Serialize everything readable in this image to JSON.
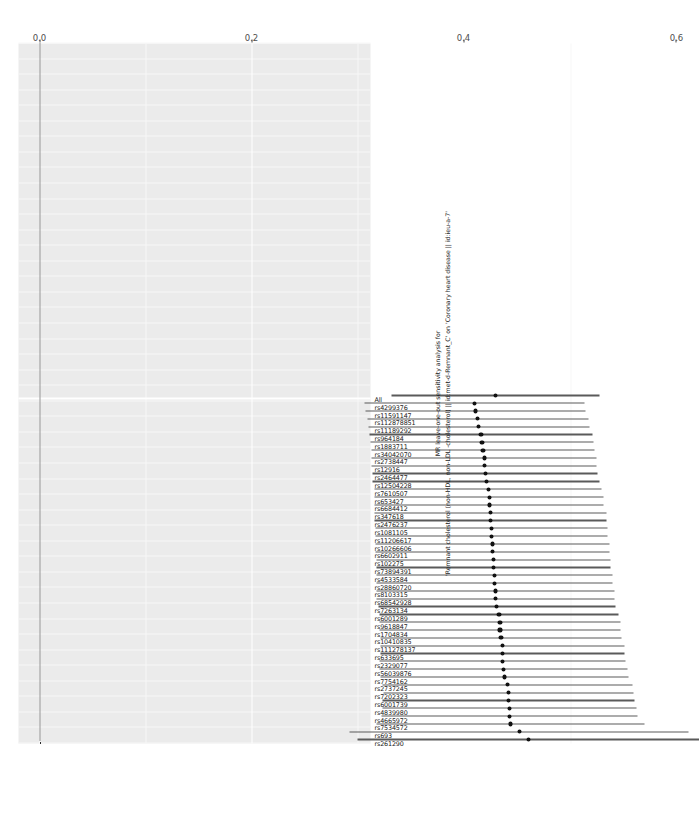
{
  "figure": {
    "kind": "forest-plot",
    "caption_lines": [
      "MR leave-one-out sensitivity analysis for",
      "'Remnant cholesterol (non-HDL, non-LDL -cholesterol) || id:met-d-Remnant_C' on 'Coronary heart disease || id:ieu-a-7'"
    ],
    "reference_line_value": "0.0"
  },
  "axis": {
    "x_ticks": [
      "0.0",
      "0.2",
      "0.4",
      "0.6"
    ],
    "x_values": [
      0.0,
      0.2,
      0.4,
      0.6
    ],
    "x_min": -0.02,
    "x_max": 0.64,
    "x_title": "",
    "y_title": ""
  },
  "chart_data": {
    "type": "forest",
    "title": "MR leave-one-out sensitivity analysis for",
    "subtitle": "'Remnant cholesterol (non-HDL, non-LDL -cholesterol) || id:met-d-Remnant_C' on 'Coronary heart disease || id:ieu-a-7'",
    "xlabel": "",
    "ylabel": "",
    "xlim": [
      -0.02,
      0.64
    ],
    "grid": true,
    "legend": "none",
    "reference_line": 0.0,
    "categories": [
      "rs261290",
      "rs693",
      "rs7534572",
      "rs4665972",
      "rs4839980",
      "rs6001739",
      "rs7202323",
      "rs2737245",
      "rs7754162",
      "rs56039876",
      "rs2329077",
      "rs633695",
      "rs111278137",
      "rs10410835",
      "rs1704834",
      "rs9618847",
      "rs6001289",
      "rs7263134",
      "rs68542928",
      "rs8103315",
      "rs28860720",
      "rs4533584",
      "rs73894391",
      "rs102275",
      "rs6602911",
      "rs10266606",
      "rs11206617",
      "rs1081105",
      "rs2476237",
      "rs347618",
      "rs6684412",
      "rs653427",
      "rs7610507",
      "rs12504228",
      "rs2464477",
      "rs12916",
      "rs2738447",
      "rs34042070",
      "rs1883711",
      "rs964184",
      "rs11189292",
      "rs112878851",
      "rs11591147",
      "rs4299376",
      "All"
    ],
    "estimates": [
      0.461,
      0.452,
      0.444,
      0.443,
      0.443,
      0.442,
      0.442,
      0.441,
      0.438,
      0.437,
      0.436,
      0.436,
      0.436,
      0.435,
      0.434,
      0.434,
      0.433,
      0.431,
      0.43,
      0.43,
      0.429,
      0.429,
      0.428,
      0.428,
      0.427,
      0.427,
      0.426,
      0.426,
      0.425,
      0.425,
      0.424,
      0.424,
      0.423,
      0.421,
      0.42,
      0.419,
      0.419,
      0.418,
      0.417,
      0.416,
      0.414,
      0.413,
      0.411,
      0.41,
      0.43
    ],
    "ci_low": [
      0.3,
      0.292,
      0.318,
      0.322,
      0.323,
      0.323,
      0.324,
      0.323,
      0.321,
      0.32,
      0.32,
      0.321,
      0.321,
      0.321,
      0.32,
      0.32,
      0.32,
      0.319,
      0.318,
      0.318,
      0.318,
      0.318,
      0.318,
      0.318,
      0.317,
      0.317,
      0.317,
      0.317,
      0.316,
      0.316,
      0.316,
      0.316,
      0.316,
      0.314,
      0.314,
      0.313,
      0.313,
      0.313,
      0.312,
      0.311,
      0.31,
      0.309,
      0.307,
      0.306,
      0.332
    ],
    "ci_high": [
      0.622,
      0.612,
      0.57,
      0.564,
      0.563,
      0.561,
      0.56,
      0.559,
      0.555,
      0.554,
      0.552,
      0.551,
      0.551,
      0.549,
      0.548,
      0.548,
      0.546,
      0.543,
      0.542,
      0.542,
      0.54,
      0.54,
      0.538,
      0.538,
      0.537,
      0.537,
      0.535,
      0.535,
      0.534,
      0.534,
      0.532,
      0.532,
      0.53,
      0.528,
      0.526,
      0.525,
      0.525,
      0.523,
      0.522,
      0.521,
      0.518,
      0.517,
      0.515,
      0.514,
      0.528
    ]
  }
}
